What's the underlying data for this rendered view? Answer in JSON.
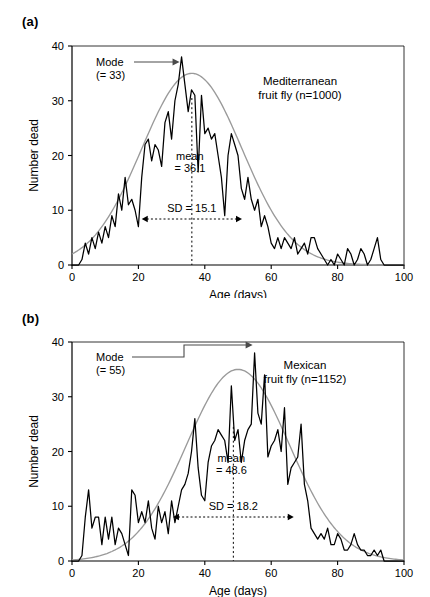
{
  "figure": {
    "panels": [
      {
        "id": "a",
        "label": "(a)",
        "series_title_line1": "Mediterranean",
        "series_title_line2": "fruit fly (n=1000)",
        "mode_label_line1": "Mode",
        "mode_label_line2": "(= 33)",
        "mean_label_line1": "mean",
        "mean_label_line2": "= 36.1",
        "sd_label": "SD = 15.1",
        "xlabel": "Age (days)",
        "ylabel": "Number dead"
      },
      {
        "id": "b",
        "label": "(b)",
        "series_title_line1": "Mexican",
        "series_title_line2": "fruit fly (n=1152)",
        "mode_label_line1": "Mode",
        "mode_label_line2": "(= 55)",
        "mean_label_line1": "mean",
        "mean_label_line2": "= 48.6",
        "sd_label": "SD = 18.2",
        "xlabel": "Age (days)",
        "ylabel": "Number dead"
      }
    ]
  },
  "chart_data": [
    {
      "type": "line",
      "panel": "a",
      "title": "Mediterranean fruit fly (n=1000)",
      "xlabel": "Age (days)",
      "ylabel": "Number dead",
      "xlim": [
        0,
        100
      ],
      "ylim": [
        0,
        40
      ],
      "xticks": [
        0,
        20,
        40,
        60,
        80,
        100
      ],
      "yticks": [
        0,
        10,
        20,
        30,
        40
      ],
      "grid": false,
      "legend": "none",
      "n": 1000,
      "mode": 33,
      "mean": 36.1,
      "sd": 15.1,
      "annotations": [
        {
          "name": "mode",
          "text": "Mode (= 33)",
          "x": 33
        },
        {
          "name": "mean",
          "text": "mean = 36.1",
          "x": 36.1
        },
        {
          "name": "sd",
          "text": "SD = 15.1",
          "from": 21.0,
          "to": 51.2
        }
      ],
      "series": [
        {
          "name": "observed deaths",
          "color": "#000000",
          "x": [
            0,
            1,
            2,
            3,
            4,
            5,
            6,
            7,
            8,
            9,
            10,
            11,
            12,
            13,
            14,
            15,
            16,
            17,
            18,
            19,
            20,
            21,
            22,
            23,
            24,
            25,
            26,
            27,
            28,
            29,
            30,
            31,
            32,
            33,
            34,
            35,
            36,
            37,
            38,
            39,
            40,
            41,
            42,
            43,
            44,
            45,
            46,
            47,
            48,
            49,
            50,
            51,
            52,
            53,
            54,
            55,
            56,
            57,
            58,
            59,
            60,
            61,
            62,
            63,
            64,
            65,
            66,
            67,
            68,
            69,
            70,
            71,
            72,
            73,
            74,
            75,
            76,
            77,
            78,
            79,
            80,
            81,
            82,
            83,
            84,
            85,
            86,
            87,
            88,
            89,
            90,
            91,
            92,
            93,
            94,
            95,
            96,
            97,
            98,
            99,
            100
          ],
          "values": [
            0,
            0,
            0,
            1,
            4,
            2,
            5,
            3,
            6,
            4,
            7,
            5,
            9,
            7,
            13,
            10,
            16,
            11,
            12,
            10,
            7,
            16,
            22,
            23,
            19,
            22,
            21,
            18,
            26,
            28,
            23,
            30,
            33,
            38,
            33,
            28,
            32,
            31,
            17,
            31,
            24,
            25,
            23,
            24,
            20,
            16,
            9,
            20,
            24,
            22,
            20,
            14,
            12,
            16,
            12,
            10,
            12,
            7,
            9,
            7,
            4,
            3,
            5,
            3,
            5,
            4,
            3,
            5,
            2,
            3,
            4,
            2,
            5,
            5,
            3,
            2,
            1,
            0,
            1,
            0,
            2,
            1,
            0,
            3,
            2,
            0,
            1,
            3,
            2,
            0,
            1,
            3,
            5,
            1,
            0,
            0,
            0,
            0,
            0,
            0,
            0
          ]
        },
        {
          "name": "fitted normal curve",
          "color": "#9a9a9a",
          "type": "normal",
          "mean": 36.1,
          "sd": 15.1,
          "peak": 35.0
        }
      ]
    },
    {
      "type": "line",
      "panel": "b",
      "title": "Mexican fruit fly (n=1152)",
      "xlabel": "Age (days)",
      "ylabel": "Number dead",
      "xlim": [
        0,
        100
      ],
      "ylim": [
        0,
        40
      ],
      "xticks": [
        0,
        20,
        40,
        60,
        80,
        100
      ],
      "yticks": [
        0,
        10,
        20,
        30,
        40
      ],
      "grid": false,
      "legend": "none",
      "n": 1152,
      "mode": 55,
      "mean": 48.6,
      "sd": 18.2,
      "annotations": [
        {
          "name": "mode",
          "text": "Mode (= 55)",
          "x": 55
        },
        {
          "name": "mean",
          "text": "mean = 48.6",
          "x": 48.6
        },
        {
          "name": "sd",
          "text": "SD = 18.2",
          "from": 30.4,
          "to": 66.8
        }
      ],
      "series": [
        {
          "name": "observed deaths",
          "color": "#000000",
          "x": [
            0,
            1,
            2,
            3,
            4,
            5,
            6,
            7,
            8,
            9,
            10,
            11,
            12,
            13,
            14,
            15,
            16,
            17,
            18,
            19,
            20,
            21,
            22,
            23,
            24,
            25,
            26,
            27,
            28,
            29,
            30,
            31,
            32,
            33,
            34,
            35,
            36,
            37,
            38,
            39,
            40,
            41,
            42,
            43,
            44,
            45,
            46,
            47,
            48,
            49,
            50,
            51,
            52,
            53,
            54,
            55,
            56,
            57,
            58,
            59,
            60,
            61,
            62,
            63,
            64,
            65,
            66,
            67,
            68,
            69,
            70,
            71,
            72,
            73,
            74,
            75,
            76,
            77,
            78,
            79,
            80,
            81,
            82,
            83,
            84,
            85,
            86,
            87,
            88,
            89,
            90,
            91,
            92,
            93,
            94,
            95,
            96,
            97,
            98,
            99,
            100
          ],
          "values": [
            0,
            0,
            0,
            1,
            8,
            13,
            6,
            8,
            8,
            3,
            8,
            4,
            8,
            3,
            6,
            5,
            3,
            1,
            13,
            12,
            7,
            9,
            7,
            11,
            6,
            4,
            10,
            7,
            9,
            5,
            11,
            7,
            10,
            13,
            14,
            16,
            20,
            26,
            17,
            12,
            11,
            18,
            21,
            22,
            24,
            23,
            22,
            18,
            32,
            22,
            24,
            18,
            22,
            24,
            25,
            38,
            27,
            25,
            34,
            19,
            21,
            22,
            24,
            20,
            28,
            14,
            17,
            18,
            19,
            25,
            14,
            11,
            6,
            5,
            4,
            5,
            4,
            6,
            3,
            3,
            5,
            4,
            2,
            2,
            3,
            5,
            3,
            2,
            2,
            1,
            1,
            2,
            1,
            2,
            0,
            0,
            0,
            0,
            0,
            0,
            0
          ]
        },
        {
          "name": "fitted normal curve",
          "color": "#9a9a9a",
          "type": "normal",
          "mean": 50.0,
          "sd": 15.5,
          "peak": 35.0
        }
      ]
    }
  ]
}
